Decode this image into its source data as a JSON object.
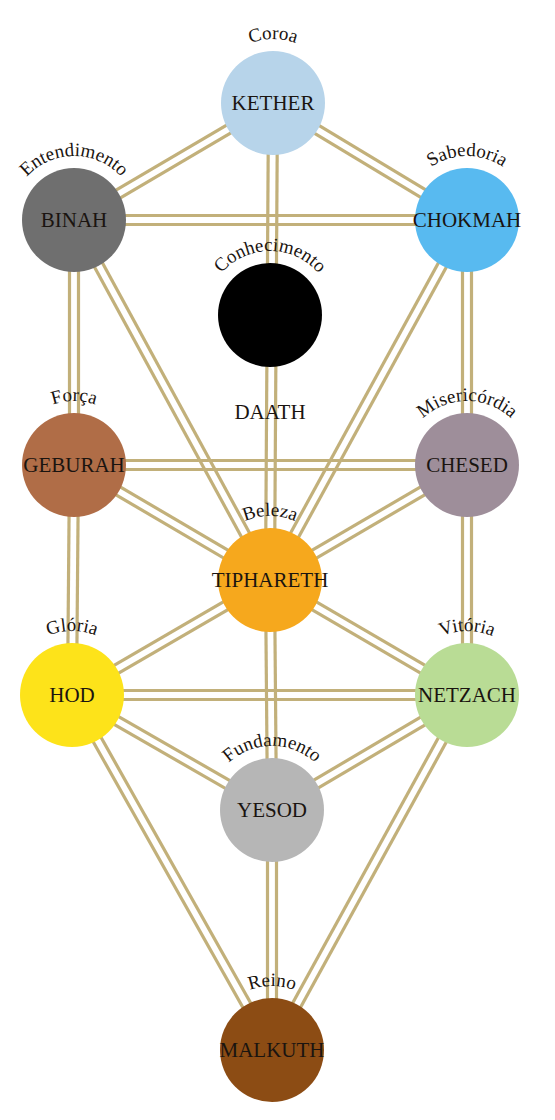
{
  "diagram": {
    "path_color": "#c2b07a",
    "node_radius": 52,
    "nodes": [
      {
        "id": "kether",
        "name": "KETHER",
        "meaning": "Coroa",
        "x": 273,
        "y": 103,
        "color": "#b7d4ea",
        "name_size": 21,
        "label_pos": "arc"
      },
      {
        "id": "binah",
        "name": "BINAH",
        "meaning": "Entendimento",
        "x": 74,
        "y": 220,
        "color": "#6f6f6f",
        "name_size": 21,
        "label_pos": "arc"
      },
      {
        "id": "chokmah",
        "name": "CHOKMAH",
        "meaning": "Sabedoria",
        "x": 467,
        "y": 220,
        "color": "#58baf0",
        "name_size": 21,
        "label_pos": "arc"
      },
      {
        "id": "daath",
        "name": "DAATH",
        "meaning": "Conhecimento",
        "x": 270,
        "y": 315,
        "color": "#000000",
        "name_size": 21,
        "label_pos": "below"
      },
      {
        "id": "geburah",
        "name": "GEBURAH",
        "meaning": "Força",
        "x": 74,
        "y": 465,
        "color": "#b06d47",
        "name_size": 21,
        "label_pos": "arc"
      },
      {
        "id": "chesed",
        "name": "CHESED",
        "meaning": "Misericórdia",
        "x": 467,
        "y": 465,
        "color": "#9e8e9a",
        "name_size": 21,
        "label_pos": "arc"
      },
      {
        "id": "tiphareth",
        "name": "TIPHARETH",
        "meaning": "Beleza",
        "x": 270,
        "y": 580,
        "color": "#f6a81d",
        "name_size": 21,
        "label_pos": "arc"
      },
      {
        "id": "hod",
        "name": "HOD",
        "meaning": "Glória",
        "x": 72,
        "y": 695,
        "color": "#fde31a",
        "name_size": 21,
        "label_pos": "arc"
      },
      {
        "id": "netzach",
        "name": "NETZACH",
        "meaning": "Vitória",
        "x": 467,
        "y": 695,
        "color": "#b9dc95",
        "name_size": 21,
        "label_pos": "arc"
      },
      {
        "id": "yesod",
        "name": "YESOD",
        "meaning": "Fundamento",
        "x": 272,
        "y": 810,
        "color": "#b6b6b6",
        "name_size": 21,
        "label_pos": "arc"
      },
      {
        "id": "malkuth",
        "name": "MALKUTH",
        "meaning": "Reino",
        "x": 272,
        "y": 1050,
        "color": "#8c4c14",
        "name_size": 21,
        "label_pos": "arc"
      }
    ],
    "paths": [
      [
        "kether",
        "binah"
      ],
      [
        "kether",
        "chokmah"
      ],
      [
        "kether",
        "tiphareth"
      ],
      [
        "binah",
        "chokmah"
      ],
      [
        "binah",
        "geburah"
      ],
      [
        "binah",
        "tiphareth"
      ],
      [
        "chokmah",
        "chesed"
      ],
      [
        "chokmah",
        "tiphareth"
      ],
      [
        "geburah",
        "chesed"
      ],
      [
        "geburah",
        "tiphareth"
      ],
      [
        "geburah",
        "hod"
      ],
      [
        "chesed",
        "tiphareth"
      ],
      [
        "chesed",
        "netzach"
      ],
      [
        "tiphareth",
        "hod"
      ],
      [
        "tiphareth",
        "netzach"
      ],
      [
        "tiphareth",
        "yesod"
      ],
      [
        "hod",
        "netzach"
      ],
      [
        "hod",
        "yesod"
      ],
      [
        "hod",
        "malkuth"
      ],
      [
        "netzach",
        "yesod"
      ],
      [
        "netzach",
        "malkuth"
      ],
      [
        "yesod",
        "malkuth"
      ]
    ]
  }
}
